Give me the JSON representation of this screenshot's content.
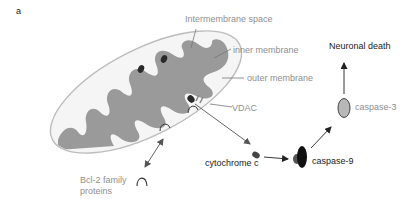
{
  "panel_label": "a",
  "labels": {
    "intermembrane_space": "Intermembrane space",
    "inner_membrane": "inner membrane",
    "outer_membrane": "outer membrane",
    "vdac": "VDAC",
    "cytochrome_c": "cytochrome c",
    "caspase_9": "caspase-9",
    "caspase_3": "caspase-3",
    "neuronal_death": "Neuronal death",
    "bcl2_line1": "Bcl-2 family",
    "bcl2_line2": "proteins"
  },
  "colors": {
    "outer_membrane": "#bdbdbd",
    "inner_matrix": "#9a9a9a",
    "organelle_fill": "#f4f4f4",
    "dark_particle": "#2a2a2a",
    "caspase3_fill": "#b8b8b8",
    "gray_text": "#8f8f8f",
    "dark_text": "#222222"
  }
}
